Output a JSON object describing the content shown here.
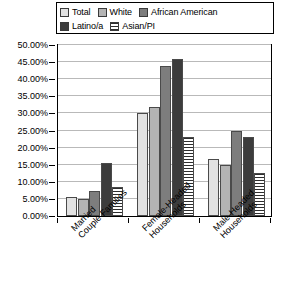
{
  "chart_data": {
    "type": "bar",
    "title": "",
    "xlabel": "",
    "ylabel": "",
    "categories": [
      "Married Couple Families",
      "Female-Headed Households",
      "Male-Headed Households"
    ],
    "category_lines": [
      [
        "Married",
        "Couple Families"
      ],
      [
        "Female-Headed",
        "Households"
      ],
      [
        "Male-Headed",
        "Households"
      ]
    ],
    "series": [
      {
        "name": "Total",
        "key": "total",
        "color": "#e2e2e2",
        "values": [
          5.7,
          30.0,
          16.8
        ]
      },
      {
        "name": "White",
        "key": "white",
        "color": "#b4b4b4",
        "values": [
          5.0,
          32.0,
          15.0
        ]
      },
      {
        "name": "African American",
        "key": "afam",
        "color": "#7d7d7d",
        "values": [
          7.2,
          44.0,
          25.0
        ]
      },
      {
        "name": "Latino/a",
        "key": "latino",
        "color": "#3c3c3c",
        "values": [
          15.6,
          46.0,
          23.0
        ]
      },
      {
        "name": "Asian/PI",
        "key": "asian",
        "color": "#ffffff",
        "values": [
          8.5,
          23.0,
          12.5
        ]
      }
    ],
    "ylim": [
      0,
      50
    ],
    "ytick_step": 5,
    "ytick_labels": [
      "50.00%",
      "45.00%",
      "40.00%",
      "35.00%",
      "30.00%",
      "25.00%",
      "20.00%",
      "15.00%",
      "10.00%",
      "5.00%",
      "0.00%"
    ],
    "ytick_values": [
      50,
      45,
      40,
      35,
      30,
      25,
      20,
      15,
      10,
      5,
      0
    ],
    "grid": true,
    "legend_position": "top"
  },
  "legend": {
    "row1": [
      {
        "label": "Total",
        "swatch": "swatch-total"
      },
      {
        "label": "White",
        "swatch": "swatch-white"
      },
      {
        "label": "African American",
        "swatch": "swatch-african-american"
      }
    ],
    "row2": [
      {
        "label": "Latino/a",
        "swatch": "swatch-latino"
      },
      {
        "label": "Asian/PI",
        "swatch": "swatch-asian-pi"
      }
    ]
  }
}
